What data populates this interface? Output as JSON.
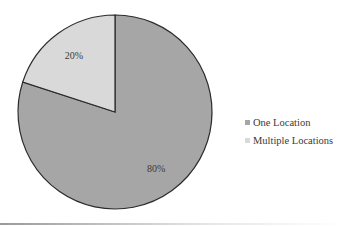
{
  "chart_data": {
    "type": "pie",
    "title": "",
    "categories": [
      "One Location",
      "Multiple Locations"
    ],
    "values": [
      80,
      20
    ],
    "unit": "%",
    "data_labels": [
      "80%",
      "20%"
    ],
    "colors": [
      "#a6a6a6",
      "#d9d9d9"
    ],
    "start_angle_deg": 0,
    "direction": "clockwise",
    "legend_position": "right"
  },
  "legend": {
    "items": [
      {
        "label": "One Location",
        "color": "#a6a6a6"
      },
      {
        "label": "Multiple Locations",
        "color": "#d9d9d9"
      }
    ]
  }
}
